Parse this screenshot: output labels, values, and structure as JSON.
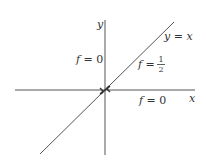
{
  "diagram": {
    "axes": {
      "x_label": "x",
      "y_label": "y"
    },
    "line": {
      "label": "y = x",
      "label_parts": {
        "lhs": "y",
        "eq": " = ",
        "rhs": "x"
      }
    },
    "regions": [
      {
        "id": "upper-left",
        "label": "f = 0",
        "parts": {
          "f": "f",
          "eq": " = ",
          "val": "0"
        }
      },
      {
        "id": "on-diagonal",
        "label": "f = 1/2",
        "parts": {
          "f": "f",
          "eq": " = ",
          "num": "1",
          "den": "2"
        }
      },
      {
        "id": "lower-right",
        "label": "f = 0",
        "parts": {
          "f": "f",
          "eq": " = ",
          "val": "0"
        }
      }
    ],
    "colors": {
      "axis": "#555555",
      "line": "#555555",
      "text": "#333333",
      "background": "#ffffff"
    }
  }
}
